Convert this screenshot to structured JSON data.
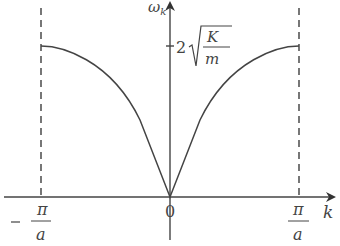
{
  "diagram": {
    "y_axis_label": "ω_k",
    "x_axis_label": "k",
    "y_tick_label": {
      "coefficient": "2",
      "numerator": "K",
      "denominator": "m"
    },
    "x_ticks": {
      "left": {
        "sign": "−",
        "numerator": "π",
        "denominator": "a"
      },
      "origin": "0",
      "right": {
        "numerator": "π",
        "denominator": "a"
      }
    },
    "colors": {
      "curve": "#444444",
      "axes": "#444444",
      "dashed": "#555555",
      "background": "#ffffff"
    }
  }
}
